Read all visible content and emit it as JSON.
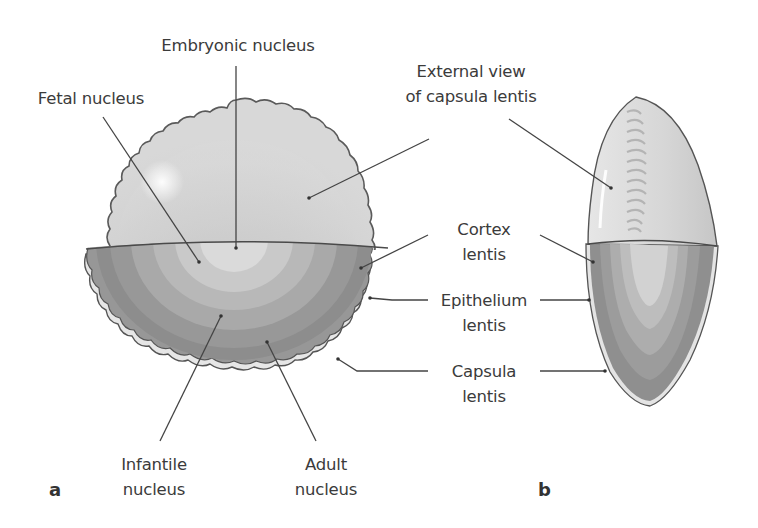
{
  "figure": {
    "panel_a_label": "a",
    "panel_b_label": "b",
    "colors": {
      "outline": "#555555",
      "leader_line": "#444444",
      "capsule_top": "#d2d2d2",
      "ring_adult_outer": "#8e8e8e",
      "ring_cortex": "#9c9c9c",
      "ring_adult": "#acacac",
      "ring_infantile": "#bdbdbd",
      "ring_fetal": "#cdcdcd",
      "ring_embryonic": "#dedede",
      "capsule_rim": "#e4e4e4"
    }
  },
  "labels": {
    "embryonic_nucleus": [
      "Embryonic nucleus"
    ],
    "fetal_nucleus": [
      "Fetal nucleus"
    ],
    "external_view": [
      "External view",
      "of capsula lentis"
    ],
    "cortex_lentis": [
      "Cortex",
      "lentis"
    ],
    "epithelium_lentis": [
      "Epithelium",
      "lentis"
    ],
    "capsula_lentis": [
      "Capsula",
      "lentis"
    ],
    "infantile_nucleus": [
      "Infantile",
      "nucleus"
    ],
    "adult_nucleus": [
      "Adult",
      "nucleus"
    ]
  }
}
